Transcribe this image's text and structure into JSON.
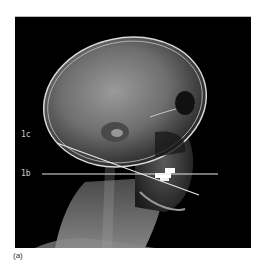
{
  "figure": {
    "labels": {
      "line_c": "1c",
      "line_b": "1b"
    },
    "caption": "(a)",
    "colors": {
      "background": "#000000",
      "line": "#e8e8e8",
      "label": "#cfcfcf"
    }
  }
}
